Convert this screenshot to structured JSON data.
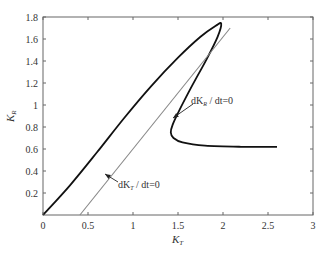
{
  "chart_data": {
    "type": "line",
    "title": "",
    "xlabel": "K_T",
    "ylabel": "K_R",
    "xlim": [
      0,
      3
    ],
    "ylim": [
      0,
      1.8
    ],
    "grid": false,
    "x_ticks": [
      "0",
      "0.5",
      "1",
      "1.5",
      "2",
      "2.5",
      "3"
    ],
    "y_ticks": [
      "0.2",
      "0.4",
      "0.6",
      "0.8",
      "1",
      "1.2",
      "1.4",
      "1.6",
      "1.8"
    ],
    "series": [
      {
        "name": "trajectory",
        "color": "#111111",
        "points": [
          [
            0,
            0
          ],
          [
            0.3,
            0.27
          ],
          [
            0.6,
            0.57
          ],
          [
            0.9,
            0.88
          ],
          [
            1.2,
            1.17
          ],
          [
            1.5,
            1.43
          ],
          [
            1.75,
            1.62
          ],
          [
            1.92,
            1.72
          ],
          [
            1.98,
            1.74
          ],
          [
            1.94,
            1.62
          ],
          [
            1.82,
            1.42
          ],
          [
            1.66,
            1.18
          ],
          [
            1.52,
            0.96
          ],
          [
            1.44,
            0.82
          ],
          [
            1.42,
            0.75
          ],
          [
            1.45,
            0.7
          ],
          [
            1.55,
            0.66
          ],
          [
            1.8,
            0.63
          ],
          [
            2.2,
            0.62
          ],
          [
            2.6,
            0.62
          ]
        ]
      },
      {
        "name": "dK_T/dt=0",
        "color": "#888888",
        "points": [
          [
            0.41,
            0
          ],
          [
            2.08,
            1.7
          ]
        ]
      }
    ],
    "annotations": [
      {
        "text": "dK_R/dt=0",
        "target": [
          1.42,
          0.75
        ],
        "label_pos": [
          1.75,
          0.9
        ]
      },
      {
        "text": "dK_T/dt=0",
        "target": [
          0.72,
          0.35
        ],
        "label_pos": [
          0.85,
          0.21
        ]
      }
    ]
  },
  "labels": {
    "xlabel_main": "K",
    "xlabel_sub": "T",
    "ylabel_main": "K",
    "ylabel_sub": "R",
    "ann1_pre": "dK",
    "ann1_sub": "R",
    "ann1_post": " / dt=0",
    "ann2_pre": "dK",
    "ann2_sub": "T",
    "ann2_post": " / dt=0"
  }
}
